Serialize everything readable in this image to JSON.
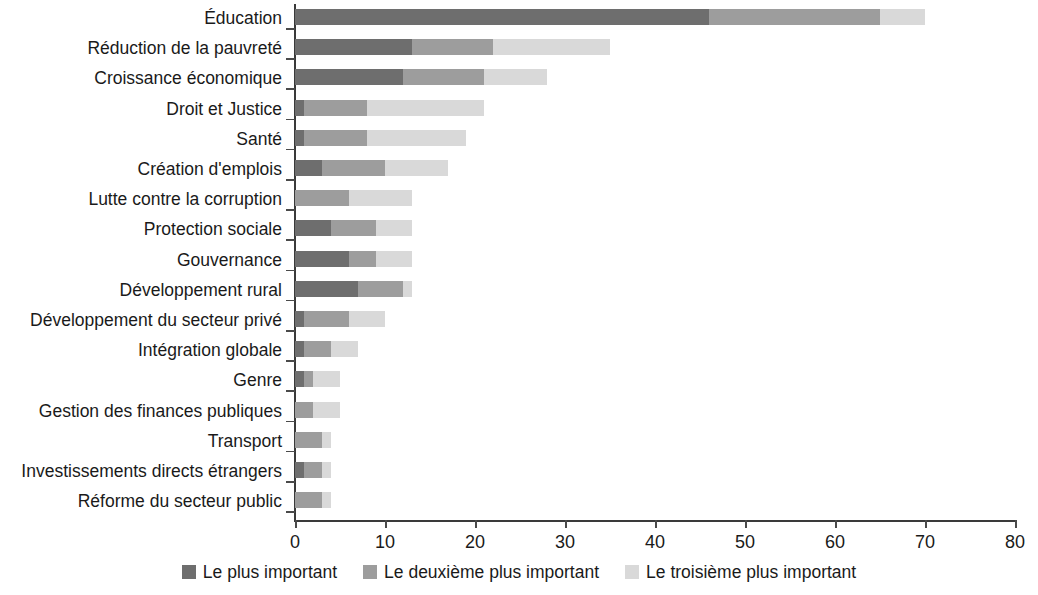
{
  "chart_data": {
    "type": "bar",
    "orientation": "horizontal",
    "stacked": true,
    "title": "",
    "subtitle": "",
    "xlabel": "",
    "ylabel": "",
    "xlim": [
      0,
      80
    ],
    "xticks": [
      0,
      10,
      20,
      30,
      40,
      50,
      60,
      70,
      80
    ],
    "xtick_labels": [
      "0",
      "10",
      "20",
      "30",
      "40",
      "50",
      "60",
      "70",
      "80"
    ],
    "grid": false,
    "legend_position": "bottom",
    "categories": [
      "Éducation",
      "Réduction de la pauvreté",
      "Croissance économique",
      "Droit et Justice",
      "Santé",
      "Création d'emplois",
      "Lutte contre la corruption",
      "Protection sociale",
      "Gouvernance",
      "Développement rural",
      "Développement du secteur privé",
      "Intégration globale",
      "Genre",
      "Gestion des finances publiques",
      "Transport",
      "Investissements directs étrangers",
      "Réforme du secteur public"
    ],
    "series": [
      {
        "name": "Le plus important",
        "color": "#6e6e6e",
        "values": [
          46,
          13,
          12,
          1,
          1,
          3,
          0,
          4,
          6,
          7,
          1,
          1,
          1,
          0,
          0,
          1,
          0
        ]
      },
      {
        "name": "Le deuxième plus important",
        "color": "#9d9d9d",
        "values": [
          19,
          9,
          9,
          7,
          7,
          7,
          6,
          5,
          3,
          5,
          5,
          3,
          1,
          2,
          3,
          2,
          3
        ]
      },
      {
        "name": "Le troisième plus important",
        "color": "#d9d9d9",
        "values": [
          5,
          13,
          7,
          13,
          11,
          7,
          7,
          4,
          4,
          1,
          4,
          3,
          3,
          3,
          1,
          1,
          1
        ]
      }
    ],
    "totals": [
      70,
      35,
      28,
      21,
      19,
      17,
      13,
      13,
      13,
      13,
      10,
      7,
      5,
      5,
      4,
      4,
      4
    ]
  },
  "legend": {
    "items": [
      {
        "label": "Le plus important",
        "color": "#6e6e6e"
      },
      {
        "label": "Le deuxième plus important",
        "color": "#9d9d9d"
      },
      {
        "label": "Le troisième plus important",
        "color": "#d9d9d9"
      }
    ]
  },
  "axis": {
    "x_tick_labels": [
      "0",
      "10",
      "20",
      "30",
      "40",
      "50",
      "60",
      "70",
      "80"
    ]
  }
}
